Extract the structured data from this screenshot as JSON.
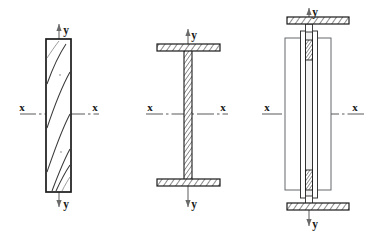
{
  "figure": {
    "background_color": "#ffffff",
    "line_color": "#1a1a1a",
    "hatch_color": "#2b2b2b",
    "axis_line_color": "#4a4a4a",
    "width": 370,
    "height": 234
  },
  "labels": {
    "x_left": "x",
    "x_right": "x",
    "y_top": "y",
    "y_bottom": "y"
  },
  "sections": [
    {
      "id": "section-rectangular-timber",
      "name": "rectangular-timber-section",
      "order": 1,
      "material": "timber",
      "fill": "grain-lines",
      "outline_stroke_width": 1.6,
      "geometry": {
        "x": 46,
        "y": 39,
        "width": 25,
        "height": 153
      },
      "axes": {
        "x_axis": {
          "y": 114,
          "x_start": 20,
          "x_end": 99,
          "label_left_x": 22,
          "label_right_x": 95,
          "style": "dash-dot"
        },
        "y_axis": {
          "x": 59,
          "y_start": 24,
          "y_end": 207,
          "label_top_y": 33,
          "label_bottom_y": 205,
          "style": "solid-thin"
        }
      },
      "grain_lines": 4,
      "labels": {
        "x_left": "x",
        "x_right": "x",
        "y_top": "y",
        "y_bottom": "y"
      }
    },
    {
      "id": "section-i-beam",
      "name": "i-beam-section",
      "order": 2,
      "material": "steel",
      "fill": "diagonal-hatch",
      "outline_stroke_width": 1.1,
      "geometry": {
        "top_flange": {
          "x": 157,
          "y": 44,
          "width": 63,
          "height": 7
        },
        "bottom_flange": {
          "x": 157,
          "y": 179,
          "width": 63,
          "height": 7
        },
        "web": {
          "x": 184,
          "y": 51,
          "width": 8,
          "height": 128
        }
      },
      "axes": {
        "x_axis": {
          "y": 114,
          "x_start": 146,
          "x_end": 228,
          "label_left_x": 148,
          "label_right_x": 222,
          "style": "dash-dot"
        },
        "y_axis": {
          "x": 188,
          "y_start": 29,
          "y_end": 207,
          "label_top_y": 33,
          "label_bottom_y": 205,
          "style": "solid-thin"
        }
      },
      "labels": {
        "x_left": "x",
        "x_right": "x",
        "y_top": "y",
        "y_bottom": "y"
      }
    },
    {
      "id": "section-built-up-composite",
      "name": "built-up-composite-section",
      "order": 3,
      "material": "steel",
      "fill": "diagonal-hatch",
      "outline_stroke_width": 1.1,
      "geometry": {
        "top_cover_plate": {
          "x": 287,
          "y": 17,
          "width": 62,
          "height": 7
        },
        "bottom_cover_plate": {
          "x": 287,
          "y": 203,
          "width": 62,
          "height": 7
        },
        "outer_box": {
          "x": 285,
          "y": 38,
          "width": 46,
          "height": 152
        },
        "inner_channel_left": {
          "x": 302,
          "y": 31,
          "width": 5,
          "height": 167
        },
        "inner_channel_right": {
          "x": 312,
          "y": 31,
          "width": 5,
          "height": 167
        },
        "web_core": {
          "x": 307,
          "y": 31,
          "width": 5,
          "height": 167
        }
      },
      "axes": {
        "x_axis": {
          "y": 114,
          "x_start": 262,
          "x_end": 362,
          "label_left_x": 266,
          "label_right_x": 354,
          "style": "dash-dot"
        },
        "y_axis": {
          "x": 309,
          "y_start": 8,
          "y_end": 226,
          "label_top_y": 14,
          "label_bottom_y": 224,
          "style": "solid-thin"
        }
      },
      "labels": {
        "x_left": "x",
        "x_right": "x",
        "y_top": "y",
        "y_bottom": "y"
      }
    }
  ]
}
